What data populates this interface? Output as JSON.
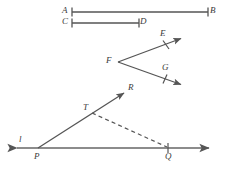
{
  "figure": {
    "background_color": "#ffffff",
    "stroke_color": "#555555",
    "label_color": "#3a3a3a",
    "width": 226,
    "height": 174
  },
  "labels": {
    "A": "A",
    "B": "B",
    "C": "C",
    "D": "D",
    "E": "E",
    "F": "F",
    "G": "G",
    "R": "R",
    "T": "T",
    "P": "P",
    "Q": "Q",
    "l": "l"
  },
  "shapes": {
    "segment_AB": {
      "name": "segment-ab",
      "from": [
        72,
        12
      ],
      "to": [
        208,
        12
      ],
      "endpoint_ticks": true
    },
    "segment_CD": {
      "name": "segment-cd",
      "from": [
        72,
        23
      ],
      "to": [
        139,
        23
      ],
      "endpoint_ticks": true
    },
    "ray_FE": {
      "name": "ray-fe",
      "from": [
        118,
        62
      ],
      "to": [
        183,
        38
      ],
      "arrow": "end",
      "tick_at": [
        166,
        44
      ]
    },
    "ray_FG": {
      "name": "ray-fg",
      "from": [
        118,
        62
      ],
      "to": [
        183,
        85
      ],
      "arrow": "end",
      "tick_at": [
        168,
        80
      ]
    },
    "line_l": {
      "name": "line-l",
      "from": [
        14,
        148
      ],
      "to": [
        212,
        148
      ],
      "arrow": "both"
    },
    "ray_PR": {
      "name": "ray-pr",
      "from": [
        38,
        148
      ],
      "to": [
        126,
        92
      ],
      "arrow": "end"
    },
    "dashed_TQ": {
      "name": "dashed-segment-tq",
      "from": [
        92,
        113
      ],
      "to": [
        168,
        148
      ],
      "style": "dashed"
    },
    "tick_Q": {
      "name": "tick-mark-q",
      "at": [
        168,
        148
      ]
    }
  },
  "label_positions": {
    "A": [
      62,
      7
    ],
    "B": [
      209,
      7
    ],
    "C": [
      62,
      18
    ],
    "D": [
      140,
      18
    ],
    "E": [
      161,
      30
    ],
    "F": [
      106,
      56
    ],
    "G": [
      163,
      64
    ],
    "R": [
      128,
      84
    ],
    "T": [
      84,
      104
    ],
    "P": [
      34,
      153
    ],
    "l": [
      19,
      136
    ]
  }
}
